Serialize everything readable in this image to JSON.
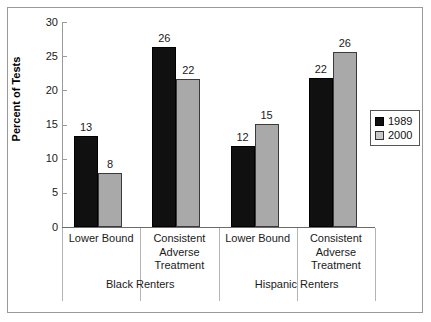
{
  "chart_data": {
    "type": "bar",
    "title": "",
    "xlabel": "",
    "ylabel": "Percent of Tests",
    "ylim": [
      0,
      30
    ],
    "yticks": [
      0,
      5,
      10,
      15,
      20,
      25,
      30
    ],
    "ytick_labels": [
      "0",
      "5",
      "10",
      "15",
      "20",
      "25",
      "30"
    ],
    "grid": false,
    "legend_position": "right",
    "categories": [
      "Lower Bound",
      "Consistent Adverse Treatment",
      "Lower Bound",
      "Consistent Adverse Treatment"
    ],
    "category_lines": [
      [
        "Lower Bound"
      ],
      [
        "Consistent",
        "Adverse",
        "Treatment"
      ],
      [
        "Lower Bound"
      ],
      [
        "Consistent",
        "Adverse",
        "Treatment"
      ]
    ],
    "groups": [
      {
        "label": "Black Renters",
        "categories": [
          0,
          1
        ]
      },
      {
        "label": "Hispanic Renters",
        "categories": [
          2,
          3
        ]
      }
    ],
    "series": [
      {
        "name": "1989",
        "color": "#101010",
        "values": [
          13,
          26,
          12,
          22
        ]
      },
      {
        "name": "2000",
        "color": "#a9a9a9",
        "values": [
          8,
          22,
          15,
          26
        ]
      }
    ],
    "bar_value_labels": [
      [
        "13",
        "26",
        "12",
        "22"
      ],
      [
        "8",
        "22",
        "15",
        "26"
      ]
    ],
    "plot_bar_heights": [
      [
        13.3,
        26.4,
        11.9,
        21.8
      ],
      [
        7.9,
        21.6,
        15.1,
        25.6
      ]
    ]
  },
  "legend": {
    "entries": [
      {
        "label": "1989",
        "color": "#101010"
      },
      {
        "label": "2000",
        "color": "#c8c8c8"
      }
    ]
  },
  "axes": {
    "y_title": "Percent of Tests"
  }
}
